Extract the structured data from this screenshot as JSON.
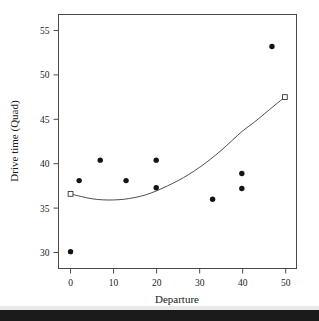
{
  "chart_data": {
    "type": "scatter",
    "title": "",
    "xlabel": "Departure",
    "ylabel": "Drive time (Quad)",
    "xlim": [
      -2.8,
      52.5
    ],
    "ylim": [
      28.2,
      56.8
    ],
    "xticks": [
      0,
      10,
      20,
      30,
      40,
      50
    ],
    "xtick_labels": [
      "0",
      "10",
      "20",
      "30",
      "40",
      "50"
    ],
    "yticks": [
      30,
      35,
      40,
      45,
      50,
      55
    ],
    "ytick_labels": [
      "30",
      "35",
      "40",
      "45",
      "50",
      "55"
    ],
    "grid": false,
    "legend": "none",
    "series": [
      {
        "name": "Observations",
        "marker": "filled-circle",
        "color": "#141414",
        "points": [
          {
            "x": 0.0,
            "y": 30.1
          },
          {
            "x": 2.0,
            "y": 38.1
          },
          {
            "x": 6.9,
            "y": 40.4
          },
          {
            "x": 12.9,
            "y": 38.1
          },
          {
            "x": 19.9,
            "y": 40.4
          },
          {
            "x": 19.9,
            "y": 37.3
          },
          {
            "x": 33.0,
            "y": 36.0
          },
          {
            "x": 39.8,
            "y": 38.9
          },
          {
            "x": 39.8,
            "y": 37.2
          },
          {
            "x": 46.8,
            "y": 53.2
          }
        ]
      },
      {
        "name": "Quadratic fit",
        "marker": "open-square-endpoints",
        "color": "#3a3a3a",
        "points": [
          {
            "x": 0.0,
            "y": 36.6
          },
          {
            "x": 2.5,
            "y": 36.3
          },
          {
            "x": 5.0,
            "y": 36.05
          },
          {
            "x": 7.5,
            "y": 35.93
          },
          {
            "x": 10.0,
            "y": 35.92
          },
          {
            "x": 12.5,
            "y": 36.0
          },
          {
            "x": 15.0,
            "y": 36.2
          },
          {
            "x": 17.5,
            "y": 36.5
          },
          {
            "x": 20.0,
            "y": 36.95
          },
          {
            "x": 22.5,
            "y": 37.5
          },
          {
            "x": 25.0,
            "y": 38.1
          },
          {
            "x": 27.5,
            "y": 38.8
          },
          {
            "x": 30.0,
            "y": 39.6
          },
          {
            "x": 32.5,
            "y": 40.5
          },
          {
            "x": 35.0,
            "y": 41.5
          },
          {
            "x": 37.5,
            "y": 42.6
          },
          {
            "x": 40.0,
            "y": 43.7
          },
          {
            "x": 42.5,
            "y": 44.6
          },
          {
            "x": 45.0,
            "y": 45.6
          },
          {
            "x": 47.5,
            "y": 46.6
          },
          {
            "x": 49.8,
            "y": 47.5
          }
        ],
        "endpoints": [
          {
            "x": 0.0,
            "y": 36.6
          },
          {
            "x": 49.8,
            "y": 47.5
          }
        ]
      }
    ]
  }
}
